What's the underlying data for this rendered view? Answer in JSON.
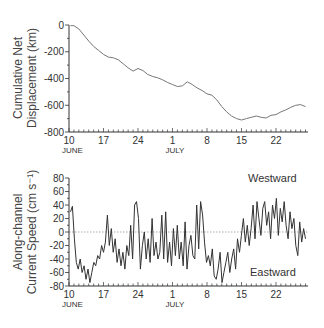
{
  "chart_data": [
    {
      "type": "line",
      "title": "",
      "ylabel": "Cumulative Net Displacement (km)",
      "ylabel_lines": [
        "Cumulative Net",
        "Displacement (km)"
      ],
      "xlabel": "",
      "ylim": [
        -800,
        0
      ],
      "yticks": [
        0,
        -200,
        -400,
        -600,
        -800
      ],
      "xticks": [
        {
          "day": 10,
          "label": "10",
          "month": "JUNE"
        },
        {
          "day": 17,
          "label": "17",
          "month": ""
        },
        {
          "day": 24,
          "label": "24",
          "month": ""
        },
        {
          "day": 31,
          "label": "1",
          "month": "JULY"
        },
        {
          "day": 38,
          "label": "8",
          "month": ""
        },
        {
          "day": 45,
          "label": "15",
          "month": ""
        },
        {
          "day": 52,
          "label": "22",
          "month": ""
        }
      ],
      "xlim": [
        10,
        58.5
      ],
      "grid": false,
      "series": [
        {
          "name": "Cumulative Net Displacement",
          "x": [
            10.3,
            11,
            12,
            13,
            14,
            15,
            16,
            17,
            18,
            19,
            20,
            21,
            22,
            23,
            24,
            25,
            26,
            27,
            28,
            29,
            30,
            31,
            32,
            33,
            34,
            35,
            36,
            37,
            38,
            39,
            40,
            41,
            42,
            43,
            44,
            45,
            46,
            47,
            48,
            49,
            50,
            51,
            52,
            53,
            54,
            55,
            56,
            57,
            58
          ],
          "values": [
            -5,
            -5,
            -30,
            -75,
            -120,
            -160,
            -190,
            -220,
            -240,
            -245,
            -260,
            -290,
            -320,
            -345,
            -325,
            -340,
            -370,
            -385,
            -395,
            -410,
            -430,
            -445,
            -460,
            -455,
            -425,
            -445,
            -470,
            -490,
            -515,
            -525,
            -560,
            -610,
            -650,
            -680,
            -700,
            -710,
            -700,
            -690,
            -680,
            -690,
            -695,
            -675,
            -670,
            -650,
            -635,
            -615,
            -600,
            -595,
            -610
          ]
        }
      ]
    },
    {
      "type": "line",
      "title": "",
      "ylabel": "Along-channel Current Speed (cm s-1)",
      "ylabel_lines": [
        "Along-channel",
        "Current Speed (cm s⁻¹)"
      ],
      "xlabel": "",
      "ylim": [
        -80,
        80
      ],
      "yticks": [
        80,
        60,
        40,
        20,
        0,
        -20,
        -40,
        -60,
        -80
      ],
      "xticks": [
        {
          "day": 10,
          "label": "10",
          "month": "JUNE"
        },
        {
          "day": 17,
          "label": "17",
          "month": ""
        },
        {
          "day": 24,
          "label": "24",
          "month": ""
        },
        {
          "day": 31,
          "label": "1",
          "month": "JULY"
        },
        {
          "day": 38,
          "label": "8",
          "month": ""
        },
        {
          "day": 45,
          "label": "15",
          "month": ""
        },
        {
          "day": 52,
          "label": "22",
          "month": ""
        }
      ],
      "xlim": [
        10,
        58.5
      ],
      "zero_line": "dotted",
      "annotations": [
        {
          "text": "Westward",
          "x": 52,
          "y": 62
        },
        {
          "text": "Eastward",
          "x": 52,
          "y": -58
        }
      ],
      "series": [
        {
          "name": "Along-channel Current Speed",
          "x": [
            10.3,
            10.6,
            11,
            11.5,
            12,
            12.5,
            13,
            13.5,
            14,
            14.5,
            15,
            15.5,
            16,
            16.5,
            17,
            17.5,
            18,
            18.5,
            19,
            19.5,
            20,
            20.5,
            21,
            21.5,
            22,
            22.5,
            23,
            23.5,
            24,
            24.5,
            25,
            25.5,
            26,
            26.5,
            27,
            27.5,
            28,
            28.5,
            29,
            29.5,
            30,
            30.5,
            31,
            31.5,
            32,
            32.5,
            33,
            33.5,
            34,
            34.5,
            35,
            35.5,
            36,
            36.5,
            37,
            37.5,
            38,
            38.5,
            39,
            39.5,
            40,
            40.5,
            41,
            41.5,
            42,
            42.5,
            43,
            43.5,
            44,
            44.5,
            45,
            45.5,
            46,
            46.5,
            47,
            47.5,
            48,
            48.5,
            49,
            49.5,
            50,
            50.5,
            51,
            51.5,
            52,
            52.5,
            53,
            53.5,
            54,
            54.5,
            55,
            55.5,
            56,
            56.5,
            57,
            57.5,
            58
          ],
          "values": [
            30,
            38,
            -10,
            -45,
            -55,
            -40,
            -60,
            -50,
            -70,
            -55,
            -75,
            -60,
            -45,
            -50,
            -35,
            -40,
            -20,
            -30,
            -15,
            25,
            -20,
            5,
            -30,
            -10,
            -45,
            -25,
            -50,
            -30,
            -55,
            -20,
            -35,
            10,
            -40,
            40,
            45,
            20,
            -55,
            -20,
            0,
            -40,
            -10,
            -45,
            20,
            -35,
            -15,
            -40,
            -30,
            25,
            -40,
            30,
            -45,
            -15,
            -50,
            5,
            -35,
            10,
            -40,
            -15,
            -50,
            15,
            -55,
            -20,
            -5,
            -35,
            -40,
            40,
            -25,
            45,
            25,
            -15,
            -45,
            -35,
            -50,
            -25,
            -65,
            -70,
            -55,
            -30,
            -75,
            -60,
            -45,
            -30,
            -60,
            -40,
            -25,
            -55,
            -10,
            -30,
            -5,
            20,
            -15,
            10,
            -20,
            5,
            40,
            -10,
            45,
            20,
            -5,
            35,
            45,
            10,
            30,
            -10,
            40,
            20,
            50,
            -5,
            35,
            15,
            45,
            10,
            -10,
            30,
            5,
            20,
            -20,
            -35,
            15,
            -15,
            5,
            -10
          ]
        }
      ]
    }
  ],
  "top_chart": {
    "ylabel_line1": "Cumulative Net",
    "ylabel_line2": "Displacement (km)",
    "yticks": [
      "0",
      "-200",
      "-400",
      "-600",
      "-800"
    ],
    "xticks": [
      "10",
      "17",
      "24",
      "1",
      "8",
      "15",
      "22"
    ],
    "month_june": "JUNE",
    "month_july": "JULY"
  },
  "bottom_chart": {
    "ylabel_line1": "Along-channel",
    "ylabel_line2": "Current Speed (cm s⁻¹)",
    "yticks": [
      "80",
      "60",
      "40",
      "20",
      "0",
      "-20",
      "-40",
      "-60",
      "-80"
    ],
    "xticks": [
      "10",
      "17",
      "24",
      "1",
      "8",
      "15",
      "22"
    ],
    "month_june": "JUNE",
    "month_july": "JULY",
    "annotation_top": "Westward",
    "annotation_bottom": "Eastward"
  }
}
